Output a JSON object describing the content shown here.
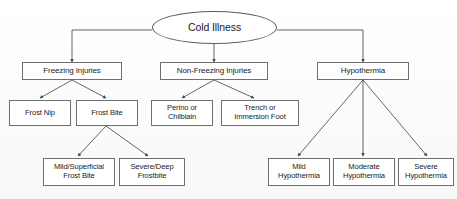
{
  "diagram": {
    "title": "Cold Illness",
    "caption": "",
    "colors": {
      "node_border": "#6f6f6f",
      "node_fill": "#ffffff",
      "edge": "#4a4a4a",
      "text": "#1b1b1b",
      "background": "#fdfdfd"
    },
    "nodes": {
      "root": {
        "label": "Cold Illness",
        "shape": "ellipse"
      },
      "freezing_injuries": {
        "label": "Freezing Injuries",
        "shape": "rectangle"
      },
      "non_freezing_injuries": {
        "label": "Non-Freezing Injuries",
        "shape": "rectangle"
      },
      "hypothermia": {
        "label": "Hypothermia",
        "shape": "rectangle"
      },
      "frost_nip": {
        "label": "Frost Nip",
        "shape": "rectangle"
      },
      "frost_bite": {
        "label": "Frost Bite",
        "shape": "rectangle"
      },
      "perino_or_chilblain": {
        "label": "Perino or\nChilblain",
        "shape": "rectangle"
      },
      "trench_or_immersion_foot": {
        "label": "Trench or\nImmersion Foot",
        "shape": "rectangle"
      },
      "mild_superficial_frost_bite": {
        "label": "Mild/Superficial\nFrost Bite",
        "shape": "rectangle"
      },
      "severe_deep_frostbite": {
        "label": "Severe/Deep\nFrostbite",
        "shape": "rectangle"
      },
      "mild_hypothermia": {
        "label": "Mild\nHypothermia",
        "shape": "rectangle"
      },
      "moderate_hypothermia": {
        "label": "Moderate\nHypothermia",
        "shape": "rectangle"
      },
      "severe_hypothermia": {
        "label": "Severe\nHypothermia",
        "shape": "rectangle"
      }
    },
    "edges": [
      {
        "from": "root",
        "to": "freezing_injuries"
      },
      {
        "from": "root",
        "to": "non_freezing_injuries"
      },
      {
        "from": "root",
        "to": "hypothermia"
      },
      {
        "from": "freezing_injuries",
        "to": "frost_nip"
      },
      {
        "from": "freezing_injuries",
        "to": "frost_bite"
      },
      {
        "from": "non_freezing_injuries",
        "to": "perino_or_chilblain"
      },
      {
        "from": "non_freezing_injuries",
        "to": "trench_or_immersion_foot"
      },
      {
        "from": "frost_bite",
        "to": "mild_superficial_frost_bite"
      },
      {
        "from": "frost_bite",
        "to": "severe_deep_frostbite"
      },
      {
        "from": "hypothermia",
        "to": "mild_hypothermia"
      },
      {
        "from": "hypothermia",
        "to": "moderate_hypothermia"
      },
      {
        "from": "hypothermia",
        "to": "severe_hypothermia"
      }
    ]
  }
}
